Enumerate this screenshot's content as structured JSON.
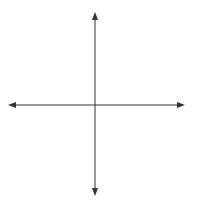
{
  "chart_data": {
    "type": "line",
    "title": "",
    "xlabel": "x",
    "ylabel": "y",
    "xlim": [
      -10,
      10
    ],
    "ylim": [
      -10,
      10
    ],
    "grid": true,
    "grid_step": 1,
    "series": [
      {
        "name": "ellipse",
        "shape": "ellipse",
        "center": [
          0,
          0
        ],
        "semi_axis_x": 6,
        "semi_axis_y": 5,
        "equation": "x^2/36 + y^2/25 = 1",
        "intercepts": {
          "x": [
            -6,
            6
          ],
          "y": [
            -5,
            5
          ]
        }
      }
    ]
  },
  "labels": {
    "x_axis": "x",
    "y_axis": "y"
  },
  "colors": {
    "grid_bg": "#dcdcdc",
    "grid_line": "#f4f4f4",
    "axis": "#333333",
    "curve": "#555555"
  }
}
